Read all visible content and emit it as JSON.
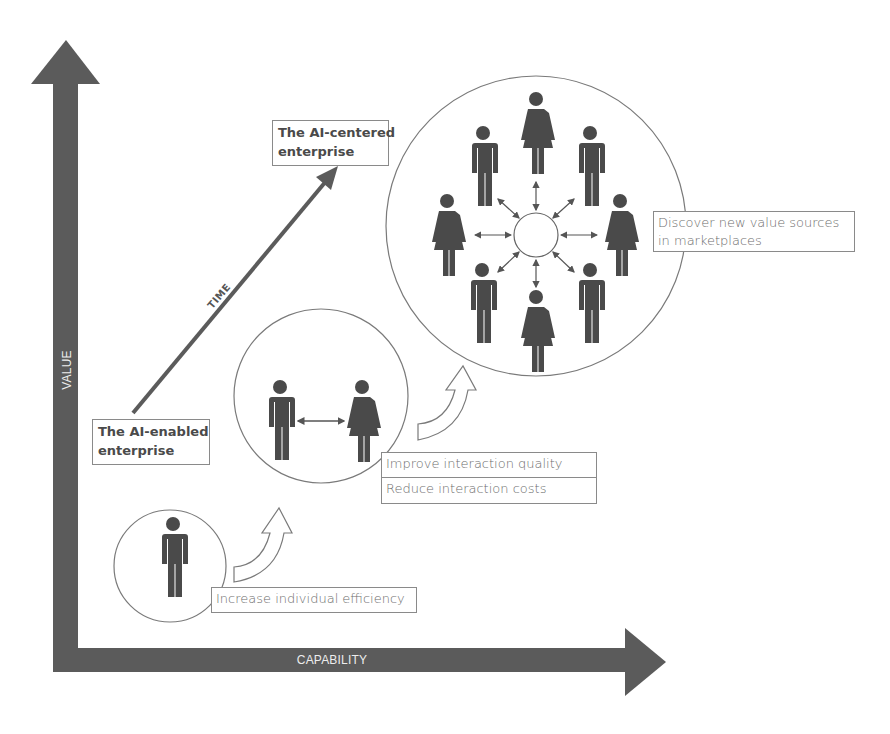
{
  "diagram": {
    "axes": {
      "y_label": "VALUE",
      "x_label": "CAPABILITY",
      "color": "#5b5b5b"
    },
    "time_arrow": {
      "label": "TIME"
    },
    "stages": {
      "start": {
        "label": "The AI-enabled enterprise",
        "line1": "The AI-enabled",
        "line2": "enterprise"
      },
      "end": {
        "label": "The AI-centered enterprise",
        "line1": "The AI-centered",
        "line2": "enterprise"
      }
    },
    "circles": [
      {
        "id": "individual",
        "people": [
          "man"
        ],
        "caption": "Increase individual efficiency"
      },
      {
        "id": "pair",
        "people": [
          "man",
          "woman"
        ],
        "captions": [
          "Improve interaction quality",
          "Reduce interaction costs"
        ]
      },
      {
        "id": "marketplace",
        "people": [
          "woman",
          "man",
          "woman",
          "man",
          "woman",
          "man",
          "woman",
          "man"
        ],
        "caption_line1": "Discover new value sources",
        "caption_line2": "in marketplaces"
      }
    ],
    "colors": {
      "figure": "#4a4a4a",
      "outline": "#7a7a7a",
      "text": "#6e6e6e",
      "background": "#ffffff"
    }
  }
}
